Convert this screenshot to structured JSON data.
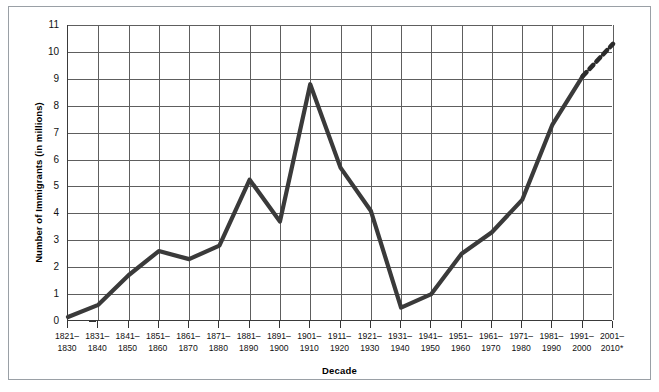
{
  "chart_data": {
    "type": "line",
    "title": "",
    "xlabel": "Decade",
    "ylabel": "Number of Immigrants (in millions)",
    "ylim": [
      0,
      11
    ],
    "yticks": [
      0,
      1,
      2,
      3,
      4,
      5,
      6,
      7,
      8,
      9,
      10,
      11
    ],
    "ytick_labels": [
      "0",
      "1",
      "2",
      "3",
      "4",
      "5",
      "6",
      "7",
      "8",
      "9",
      "10",
      "11"
    ],
    "grid": true,
    "legend": "none",
    "categories": [
      "1821–1830",
      "1831–1840",
      "1841–1850",
      "1851–1860",
      "1861–1870",
      "1871–1880",
      "1881–1890",
      "1891–1900",
      "1901–1910",
      "1911–1920",
      "1921–1930",
      "1931–1940",
      "1941–1950",
      "1951–1960",
      "1961–1970",
      "1971–1980",
      "1981–1990",
      "1991–2000",
      "2001–2010*"
    ],
    "category_lines": [
      [
        "1821–",
        "1830"
      ],
      [
        "1831–",
        "1840"
      ],
      [
        "1841–",
        "1850"
      ],
      [
        "1851–",
        "1860"
      ],
      [
        "1861–",
        "1870"
      ],
      [
        "1871–",
        "1880"
      ],
      [
        "1881–",
        "1890"
      ],
      [
        "1891–",
        "1900"
      ],
      [
        "1901–",
        "1910"
      ],
      [
        "1911–",
        "1920"
      ],
      [
        "1921–",
        "1930"
      ],
      [
        "1931–",
        "1940"
      ],
      [
        "1941–",
        "1950"
      ],
      [
        "1951–",
        "1960"
      ],
      [
        "1961–",
        "1970"
      ],
      [
        "1971–",
        "1980"
      ],
      [
        "1981–",
        "1990"
      ],
      [
        "1991–",
        "2000"
      ],
      [
        "2001–",
        "2010*"
      ]
    ],
    "values": [
      0.15,
      0.6,
      1.7,
      2.6,
      2.3,
      2.8,
      5.25,
      3.7,
      8.8,
      5.7,
      4.1,
      0.5,
      1.0,
      2.5,
      3.3,
      4.5,
      7.3,
      9.1,
      10.3
    ],
    "series": [
      {
        "name": "Number of Immigrants",
        "values": [
          0.15,
          0.6,
          1.7,
          2.6,
          2.3,
          2.8,
          5.25,
          3.7,
          8.8,
          5.7,
          4.1,
          0.5,
          1.0,
          2.5,
          3.3,
          4.5,
          7.3,
          9.1,
          10.3
        ],
        "line_color": "#3a3a3a",
        "line_width": 4,
        "dashed_from_index": 17
      }
    ],
    "annotations": [
      "* projected, shown as dashed segment"
    ]
  },
  "colors": {
    "line": "#3a3a3a",
    "grid": "#5e5e5e",
    "axis": "#3a3a3a",
    "frame": "#9aa0a6",
    "background": "#ffffff",
    "text": "#111111"
  }
}
